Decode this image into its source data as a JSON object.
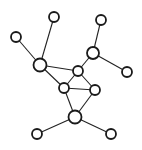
{
  "diagram": {
    "type": "network-graph",
    "colors": {
      "background": "#ffffff",
      "edge": "#222222",
      "node_stroke": "#1a1a1a",
      "node_fill": "#ffffff"
    },
    "nodes": [
      {
        "id": "A",
        "x": 16,
        "y": 37,
        "r": 5
      },
      {
        "id": "B",
        "x": 54,
        "y": 17,
        "r": 5
      },
      {
        "id": "C",
        "x": 40,
        "y": 65,
        "r": 6.5
      },
      {
        "id": "D",
        "x": 101,
        "y": 20,
        "r": 5
      },
      {
        "id": "E",
        "x": 93,
        "y": 53,
        "r": 6
      },
      {
        "id": "F",
        "x": 127,
        "y": 72,
        "r": 5
      },
      {
        "id": "G",
        "x": 78,
        "y": 71,
        "r": 5
      },
      {
        "id": "H",
        "x": 64,
        "y": 88,
        "r": 5
      },
      {
        "id": "I",
        "x": 95,
        "y": 90,
        "r": 5
      },
      {
        "id": "J",
        "x": 75,
        "y": 117,
        "r": 6.5
      },
      {
        "id": "K",
        "x": 37,
        "y": 134,
        "r": 5
      },
      {
        "id": "L",
        "x": 111,
        "y": 134,
        "r": 5
      }
    ],
    "edges": [
      [
        "A",
        "C"
      ],
      [
        "B",
        "C"
      ],
      [
        "C",
        "G"
      ],
      [
        "C",
        "H"
      ],
      [
        "D",
        "E"
      ],
      [
        "E",
        "F"
      ],
      [
        "E",
        "G"
      ],
      [
        "G",
        "H"
      ],
      [
        "G",
        "I"
      ],
      [
        "H",
        "I"
      ],
      [
        "H",
        "J"
      ],
      [
        "I",
        "J"
      ],
      [
        "J",
        "K"
      ],
      [
        "J",
        "L"
      ]
    ]
  }
}
